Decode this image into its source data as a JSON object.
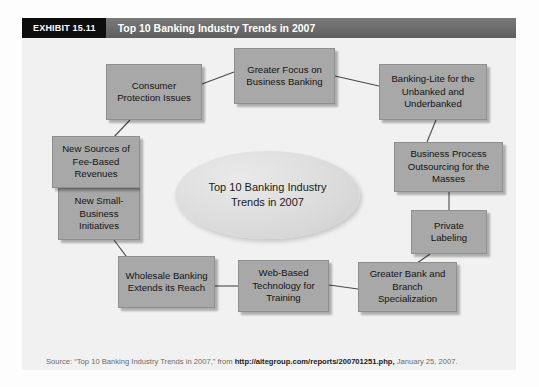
{
  "header": {
    "exhibit_tag": "EXHIBIT 15.11",
    "title": "Top 10 Banking Industry Trends in 2007"
  },
  "center": {
    "label": "Top 10 Banking Industry Trends in 2007"
  },
  "nodes": [
    {
      "id": "consumer-protection-issues",
      "label": "Consumer Protection Issues"
    },
    {
      "id": "greater-focus-on-business-banking",
      "label": "Greater Focus on Business Banking"
    },
    {
      "id": "banking-lite-for-the-unbanked-and-underbanked",
      "label": "Banking-Lite for the Unbanked and Underbanked"
    },
    {
      "id": "business-process-outsourcing-for-the-masses",
      "label": "Business Process Outsourcing for the Masses"
    },
    {
      "id": "private-labeling",
      "label": "Private Labeling"
    },
    {
      "id": "greater-bank-and-branch-specialization",
      "label": "Greater Bank and Branch Specialization"
    },
    {
      "id": "web-based-technology-for-training",
      "label": "Web-Based Technology for Training"
    },
    {
      "id": "wholesale-banking-extends-its-reach",
      "label": "Wholesale Banking Extends its Reach"
    },
    {
      "id": "new-small-business-initiatives",
      "label": "New Small-Business Initiatives"
    },
    {
      "id": "new-sources-of-fee-based-revenues",
      "label": "New Sources of Fee-Based Revenues"
    }
  ],
  "source": {
    "line1_prefix": "Source: “Top 10 Banking Industry Trends in 2007,” from ",
    "line1_url": "http://aitegroup.com/reports/200701251.php,",
    "line1_suffix": " January 25, 2007.",
    "line2": "Copyright © 2007 by Aite Group LLC. All right reserved. Reproduced by permission."
  },
  "colors": {
    "node_fill": "#a8a8a8",
    "panel_bg": "#f1f1f1",
    "header_tag_bg": "#0d0d0d",
    "header_bar_bg": "#6b6b6b",
    "connector": "#4a4a4a"
  }
}
